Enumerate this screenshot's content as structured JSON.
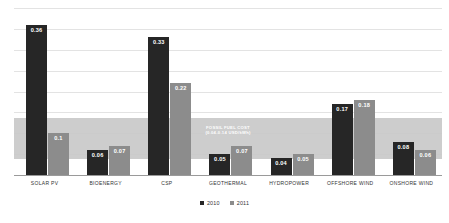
{
  "chart_data": {
    "type": "bar",
    "title": "",
    "xlabel": "",
    "ylabel": "",
    "ylim": [
      0,
      0.4
    ],
    "grid": true,
    "legend_position": "bottom",
    "categories": [
      "SOLAR PV",
      "BIOENERGY",
      "CSP",
      "GEOTHERMAL",
      "HYDROPOWER",
      "OFFSHORE WIND",
      "ONSHORE WIND"
    ],
    "series": [
      {
        "name": "2010",
        "color": "#262626",
        "values": [
          0.36,
          0.06,
          0.33,
          0.05,
          0.04,
          0.17,
          0.08
        ]
      },
      {
        "name": "2011",
        "color": "#8c8c8c",
        "values": [
          0.1,
          0.07,
          0.22,
          0.07,
          0.05,
          0.18,
          0.06
        ]
      }
    ],
    "value_labels": {
      "2010": [
        "0.36",
        "0.06",
        "0.33",
        "0.05",
        "0.04",
        "0.17",
        "0.08"
      ],
      "2011": [
        "0.1",
        "0.07",
        "0.22",
        "0.07",
        "0.05",
        "0.18",
        "0.06"
      ]
    },
    "gridlines": [
      0.05,
      0.1,
      0.15,
      0.2,
      0.25,
      0.3,
      0.35,
      0.4
    ],
    "annotations": [
      {
        "name": "fossil-fuel-cost-band",
        "line1": "FOSSIL FUEL COST",
        "line2": "(0.04-0.14 USD/kWh)",
        "range": [
          0.04,
          0.14
        ],
        "color": "#c9c9c9",
        "text_color": "#ffffff"
      }
    ]
  },
  "legend": {
    "items": [
      {
        "label": "2010",
        "color": "#262626"
      },
      {
        "label": "2011",
        "color": "#8c8c8c"
      }
    ]
  }
}
